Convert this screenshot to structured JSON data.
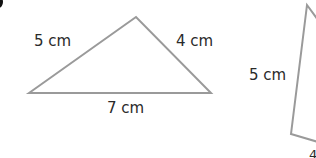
{
  "diagram": {
    "type": "triangles",
    "stroke_color": "#9a9a9a",
    "text_color": "#2a2a2a",
    "triangles": [
      {
        "name": "triangle-1",
        "vertices": [
          [
            29,
            93
          ],
          [
            136,
            17
          ],
          [
            211,
            93
          ]
        ],
        "labels": {
          "left_side": "5 cm",
          "right_side": "4 cm",
          "base": "7 cm"
        }
      },
      {
        "name": "triangle-2",
        "vertices": [
          [
            307,
            5
          ],
          [
            291,
            134
          ],
          [
            316,
            141
          ]
        ],
        "labels": {
          "left_side": "5 cm",
          "bottom_partial": "4"
        }
      }
    ]
  }
}
